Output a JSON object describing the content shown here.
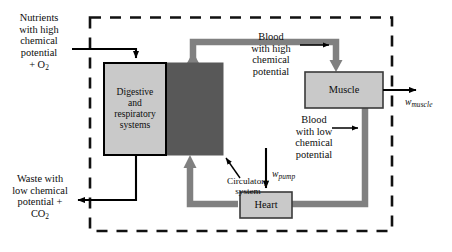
{
  "diagram": {
    "system_boundary": {
      "name": "system-boundary",
      "style": "dashed",
      "color": "#111111"
    },
    "boxes": [
      {
        "id": "digestive",
        "label": "Digestive\nand\nrespiratory\nsystems",
        "fill": "#c9c9c9",
        "stroke": "#000000"
      },
      {
        "id": "circulatory-block",
        "label": "",
        "fill": "#585858",
        "stroke": "#585858"
      },
      {
        "id": "muscle",
        "label": "Muscle",
        "fill": "#c9c9c9",
        "stroke": "#3a3a3a"
      },
      {
        "id": "heart",
        "label": "Heart",
        "fill": "#c9c9c9",
        "stroke": "#3a3a3a"
      }
    ],
    "flow_labels": [
      {
        "id": "nutrients-in",
        "text": "Nutrients\nwith high\nchemical\npotential\n+ O",
        "subscript": "2",
        "kind": "input",
        "arrow_color": "#000000"
      },
      {
        "id": "waste-out",
        "text": "Waste with\nlow chemical\npotential +\nCO",
        "subscript": "2",
        "kind": "output",
        "arrow_color": "#000000"
      },
      {
        "id": "blood-high",
        "text": "Blood\nwith high\nchemical\npotential",
        "kind": "annotation",
        "arrow_color": "#000000"
      },
      {
        "id": "blood-low",
        "text": "Blood\nwith low\nchemical\npotential",
        "kind": "annotation",
        "arrow_color": "#000000"
      },
      {
        "id": "circulatory-system",
        "text": "Circulatory\nsystem",
        "kind": "annotation",
        "arrow_color": "#000000"
      }
    ],
    "work_outputs": [
      {
        "id": "w-muscle",
        "symbol": "w",
        "subscript": "muscle",
        "arrow_color": "#000000"
      },
      {
        "id": "w-pump",
        "symbol": "w",
        "subscript": "pump",
        "arrow_color": "#000000"
      }
    ],
    "colors": {
      "blood_flow_arrow": "#808080",
      "mass_flow_arrow": "#000000",
      "box_fill_light": "#c9c9c9",
      "box_fill_dark": "#585858",
      "boundary": "#111111",
      "background": "#ffffff"
    }
  }
}
